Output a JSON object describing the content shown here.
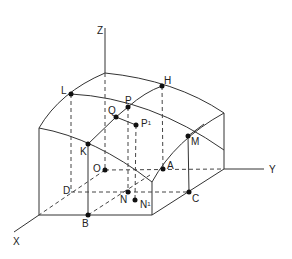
{
  "diagram": {
    "title": "",
    "axes": [
      {
        "name": "X",
        "label": "X",
        "x": 13,
        "y": 237
      },
      {
        "name": "Y",
        "label": "Y",
        "x": 269,
        "y": 165
      },
      {
        "name": "Z",
        "label": "Z",
        "x": 97,
        "y": 26
      }
    ],
    "points": [
      {
        "name": "L",
        "label": "L",
        "cx": 71,
        "cy": 94,
        "lx": 61,
        "ly": 86
      },
      {
        "name": "H",
        "label": "H",
        "cx": 162,
        "cy": 86,
        "lx": 164,
        "ly": 76
      },
      {
        "name": "P",
        "label": "P",
        "cx": 128,
        "cy": 107,
        "lx": 125,
        "ly": 96
      },
      {
        "name": "Q",
        "label": "Q",
        "cx": 116,
        "cy": 117,
        "lx": 108,
        "ly": 106
      },
      {
        "name": "P1",
        "label": "P",
        "sup": "1",
        "cx": 136,
        "cy": 125,
        "lx": 141,
        "ly": 119
      },
      {
        "name": "K",
        "label": "K",
        "cx": 88,
        "cy": 144,
        "lx": 80,
        "ly": 147
      },
      {
        "name": "M",
        "label": "M",
        "cx": 188,
        "cy": 136,
        "lx": 191,
        "ly": 137
      },
      {
        "name": "O",
        "label": "O",
        "cx": 105,
        "cy": 170,
        "lx": 93,
        "ly": 164
      },
      {
        "name": "A",
        "label": "A",
        "cx": 163,
        "cy": 169,
        "lx": 167,
        "ly": 161
      },
      {
        "name": "D",
        "label": "D",
        "cx": null,
        "cy": null,
        "lx": 63,
        "ly": 186
      },
      {
        "name": "N",
        "label": "N",
        "cx": 128,
        "cy": 192,
        "lx": 120,
        "ly": 195
      },
      {
        "name": "N1",
        "label": "N",
        "sup": "1",
        "cx": 135,
        "cy": 200,
        "lx": 140,
        "ly": 200
      },
      {
        "name": "C",
        "label": "C",
        "cx": 189,
        "cy": 192,
        "lx": 192,
        "ly": 194
      },
      {
        "name": "B",
        "label": "B",
        "cx": 88,
        "cy": 215,
        "lx": 82,
        "ly": 219
      }
    ],
    "colors": {
      "line": "#333333",
      "point": "#111111",
      "background": "#ffffff"
    }
  }
}
